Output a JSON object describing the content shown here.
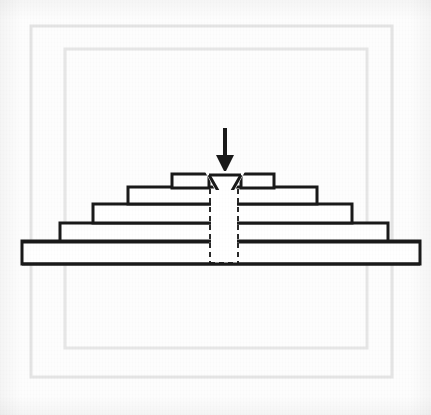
{
  "figure": {
    "caption": "",
    "background_color": "#fdfdfd",
    "line_color": "#1a1a1a",
    "fill_color": "#ffffff",
    "frame_color": "#e2e2e2",
    "dashed_color": "#2a2a2a"
  },
  "frames": [
    {
      "name": "outer-frame",
      "x": 31,
      "y": 26,
      "width": 361,
      "height": 351,
      "stroke": "#e4e4e4",
      "stroke_width": 3
    },
    {
      "name": "inner-frame",
      "x": 65,
      "y": 49,
      "width": 302,
      "height": 299,
      "stroke": "#e6e6e6",
      "stroke_width": 3
    }
  ],
  "arrow": {
    "label": "load-arrow",
    "shaft_x": 225,
    "shaft_top_y": 128,
    "shaft_bottom_y": 159,
    "shaft_width": 4,
    "head_half_width": 9,
    "head_top_y": 155,
    "head_tip_y": 173,
    "color": "#1a1a1a"
  },
  "steps": [
    {
      "name": "step-top-left",
      "x": 172,
      "y": 174,
      "width": 37,
      "height": 14,
      "label": "top step left"
    },
    {
      "name": "step-top-right",
      "x": 241,
      "y": 174,
      "width": 33,
      "height": 14,
      "label": "top step right"
    },
    {
      "name": "step-4",
      "x": 128,
      "y": 187,
      "width": 189,
      "height": 17,
      "label": "fourth step"
    },
    {
      "name": "step-3",
      "x": 93,
      "y": 204,
      "width": 259,
      "height": 19,
      "label": "third step"
    },
    {
      "name": "step-2",
      "x": 60,
      "y": 223,
      "width": 328,
      "height": 18,
      "label": "second step"
    },
    {
      "name": "step-1-base",
      "x": 22,
      "y": 241,
      "width": 398,
      "height": 23,
      "label": "base plate"
    }
  ],
  "notch": {
    "name": "v-notch-triangle",
    "left_x": 209,
    "right_x": 241,
    "top_y": 174,
    "apex_x": 225,
    "apex_y": 203,
    "fill": "#ffffff"
  },
  "channel": {
    "name": "dashed-vertical-channel",
    "left_x": 210,
    "right_x": 238,
    "top_y": 189,
    "bottom_y": 263,
    "dash_pattern": "5,4",
    "stroke": "#2a2a2a",
    "stroke_width": 2
  },
  "geometry": {
    "canvas_width": 431,
    "canvas_height": 415,
    "step_count": 5,
    "centerline_x": 225
  }
}
